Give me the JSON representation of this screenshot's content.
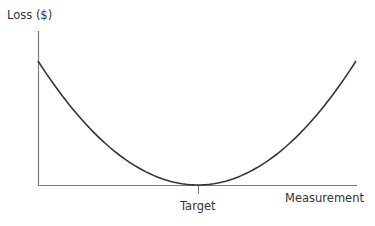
{
  "chart_data": {
    "type": "line",
    "title": "",
    "xlabel": "Measurement",
    "ylabel": "Loss ($)",
    "x_tick_labels": [
      "Target"
    ],
    "series": [
      {
        "name": "Loss function",
        "shape": "quadratic",
        "x": [
          -1.0,
          -0.75,
          -0.5,
          -0.25,
          0.0,
          0.25,
          0.5,
          0.75,
          1.0
        ],
        "values": [
          0.99,
          0.56,
          0.25,
          0.06,
          0.0,
          0.06,
          0.25,
          0.56,
          1.0
        ]
      }
    ],
    "annotations": [
      {
        "text": "Target",
        "x": 0.0,
        "note": "minimum of the loss curve at target value"
      }
    ],
    "grid": false,
    "legend": "none",
    "ylim": [
      0,
      1.25
    ],
    "xlim": [
      -1.0,
      1.0
    ],
    "colors": {
      "curve": "#333333",
      "axis": "#777777",
      "text": "#333333"
    }
  },
  "labels": {
    "y_axis": "Loss ($)",
    "x_axis": "Measurement",
    "target": "Target"
  }
}
